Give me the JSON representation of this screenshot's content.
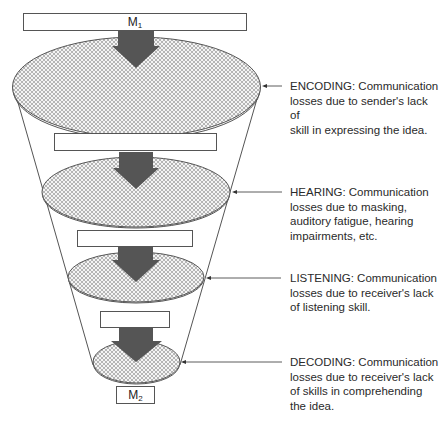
{
  "colors": {
    "outline": "#555555",
    "arrow_fill": "#555555",
    "hatch_line": "#9a9a9a",
    "hatch_bg": "#f2f2f2",
    "text": "#2a2a2a",
    "background": "#ffffff"
  },
  "message_in": {
    "symbol": "M",
    "subscript": "1"
  },
  "message_out": {
    "symbol": "M",
    "subscript": "2"
  },
  "stages": [
    {
      "name": "ENCODING",
      "text": "ENCODING: Communication\nlosses due to sender's lack of\nskill in expressing the idea."
    },
    {
      "name": "HEARING",
      "text": "HEARING: Communication\nlosses due to masking,\nauditory fatigue, hearing\nimpairments, etc."
    },
    {
      "name": "LISTENING",
      "text": "LISTENING: Communication\nlosses due to receiver's lack\nof listening skill."
    },
    {
      "name": "DECODING",
      "text": "DECODING: Communication\nlosses due to receiver's lack\nof skills in comprehending\nthe idea."
    }
  ]
}
